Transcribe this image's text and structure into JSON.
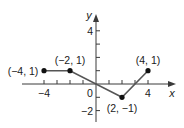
{
  "chart_data": {
    "type": "line",
    "title": "",
    "xlabel": "x",
    "ylabel": "y",
    "xlim": [
      -5.8,
      5.9
    ],
    "ylim": [
      -2.9,
      5.0
    ],
    "grid": false,
    "legend": null,
    "x_ticks": [
      -4,
      -3,
      -2,
      -1,
      0,
      1,
      2,
      3,
      4
    ],
    "x_tick_labels": [
      {
        "value": -4,
        "label": "−4"
      },
      {
        "value": 0,
        "label": "0"
      },
      {
        "value": 4,
        "label": "4"
      }
    ],
    "y_ticks": [
      -2,
      -1,
      1,
      2,
      3,
      4
    ],
    "y_tick_labels": [
      {
        "value": 4,
        "label": "4"
      },
      {
        "value": -2,
        "label": "−2"
      }
    ],
    "series": [
      {
        "name": "piecewise",
        "x": [
          -4,
          -2,
          2,
          4
        ],
        "y": [
          1,
          1,
          -1,
          1
        ],
        "closed_endpoints": true
      }
    ],
    "annotations": [
      {
        "x": -4,
        "y": 1,
        "text": "(−4, 1)"
      },
      {
        "x": -2,
        "y": 1,
        "text": "(−2, 1)"
      },
      {
        "x": 2,
        "y": -1,
        "text": "(2, −1)"
      },
      {
        "x": 4,
        "y": 1,
        "text": "(4, 1)"
      }
    ]
  }
}
